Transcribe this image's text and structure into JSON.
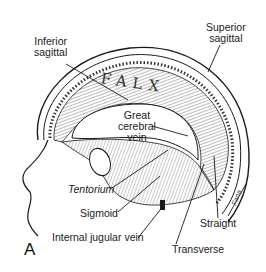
{
  "figure": {
    "panel_letter": "A",
    "structure_text": "FALX",
    "labels": {
      "inferior_sagittal": [
        "Inferior",
        "sagittal"
      ],
      "superior_sagittal": [
        "Superior",
        "sagittal"
      ],
      "great_cerebral_vein": [
        "Great",
        "cerebral",
        "vein"
      ],
      "tentorium": "Tentorium",
      "sigmoid": "Sigmoid",
      "internal_jugular_vein": "Internal jugular vein",
      "transverse": "Transverse",
      "straight": "Straight"
    },
    "colors": {
      "ink": "#1a1a1a",
      "background": "#ffffff"
    }
  }
}
